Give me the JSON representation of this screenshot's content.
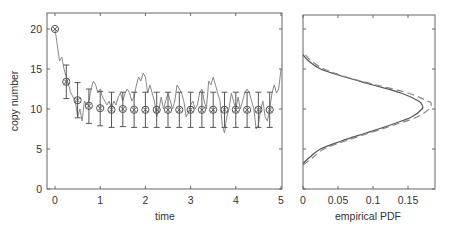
{
  "chart_data": [
    {
      "type": "line",
      "panel": "left",
      "title": "",
      "xlabel": "time",
      "ylabel": "copy number",
      "xlim": [
        -0.2,
        5
      ],
      "ylim": [
        0,
        22
      ],
      "xticks": [
        0,
        1,
        2,
        3,
        4,
        5
      ],
      "yticks": [
        0,
        5,
        10,
        15,
        20
      ],
      "grid": false,
      "series": [
        {
          "name": "sample trajectory",
          "style": "solid gray line",
          "x": [
            0,
            0.05,
            0.1,
            0.15,
            0.2,
            0.25,
            0.3,
            0.35,
            0.4,
            0.45,
            0.5,
            0.55,
            0.6,
            0.65,
            0.7,
            0.75,
            0.8,
            0.85,
            0.9,
            0.95,
            1.0,
            1.05,
            1.1,
            1.15,
            1.2,
            1.25,
            1.3,
            1.35,
            1.4,
            1.45,
            1.5,
            1.55,
            1.6,
            1.65,
            1.7,
            1.75,
            1.8,
            1.85,
            1.9,
            1.95,
            2.0,
            2.05,
            2.1,
            2.15,
            2.2,
            2.25,
            2.3,
            2.35,
            2.4,
            2.45,
            2.5,
            2.55,
            2.6,
            2.65,
            2.7,
            2.75,
            2.8,
            2.85,
            2.9,
            2.95,
            3.0,
            3.05,
            3.1,
            3.15,
            3.2,
            3.25,
            3.3,
            3.35,
            3.4,
            3.45,
            3.5,
            3.55,
            3.6,
            3.65,
            3.7,
            3.75,
            3.8,
            3.85,
            3.9,
            3.95,
            4.0,
            4.05,
            4.1,
            4.15,
            4.2,
            4.25,
            4.3,
            4.35,
            4.4,
            4.45,
            4.5,
            4.55,
            4.6,
            4.65,
            4.7,
            4.75,
            4.8,
            4.85,
            4.9,
            4.95,
            5.0
          ],
          "y": [
            20,
            18,
            16,
            16.5,
            15,
            14,
            13,
            12,
            11.5,
            11,
            9,
            10,
            8.5,
            11,
            10.5,
            11,
            12.5,
            13.5,
            13,
            12,
            12.5,
            11.5,
            11,
            10.5,
            11,
            10,
            11,
            10.5,
            11.5,
            12,
            11,
            12,
            12.5,
            12,
            11,
            11.5,
            13,
            14,
            13.5,
            14.5,
            14,
            12,
            13,
            12,
            11,
            9,
            10,
            11.5,
            10,
            11,
            12,
            11,
            10,
            11,
            13,
            12.5,
            12,
            11,
            9,
            9.5,
            10.5,
            11,
            10,
            10.5,
            12,
            12.5,
            11,
            10,
            13.5,
            13,
            14,
            13,
            12,
            11,
            8,
            7,
            9,
            10,
            12,
            11,
            10,
            11.5,
            10,
            11,
            12,
            12.5,
            12,
            11,
            10,
            7.5,
            8,
            10,
            11,
            9,
            8.5,
            10,
            12,
            13,
            12,
            12.5,
            15
          ]
        },
        {
          "name": "mean ± std (markers with error bars)",
          "style": "circle-x markers with vertical error bars",
          "x": [
            0,
            0.25,
            0.5,
            0.75,
            1.0,
            1.25,
            1.5,
            1.75,
            2.0,
            2.25,
            2.5,
            2.75,
            3.0,
            3.25,
            3.5,
            3.75,
            4.0,
            4.25,
            4.5,
            4.75
          ],
          "mean": [
            20,
            13.4,
            11.1,
            10.4,
            10.1,
            9.9,
            10.0,
            9.9,
            9.9,
            9.9,
            9.9,
            9.9,
            9.9,
            9.9,
            9.9,
            9.9,
            9.9,
            9.9,
            9.9,
            9.9
          ],
          "upper": [
            20,
            15.5,
            13.3,
            12.5,
            12.2,
            12.1,
            12.1,
            12.1,
            12.1,
            12.1,
            12.1,
            12.1,
            12.1,
            12.1,
            12.1,
            12.1,
            12.1,
            12.1,
            12.1,
            12.1
          ],
          "lower": [
            20,
            11.3,
            8.9,
            8.2,
            7.9,
            7.7,
            7.8,
            7.7,
            7.7,
            7.7,
            7.7,
            7.7,
            7.7,
            7.7,
            7.7,
            7.7,
            7.7,
            7.7,
            7.7,
            7.7
          ]
        }
      ]
    },
    {
      "type": "line",
      "panel": "right",
      "title": "",
      "xlabel": "empirical PDF",
      "ylabel": "",
      "xlim": [
        0,
        0.19
      ],
      "ylim": [
        0,
        22
      ],
      "xticks": [
        0,
        0.05,
        0.1,
        0.15
      ],
      "yticks": [
        0,
        5,
        10,
        15,
        20
      ],
      "show_ytick_labels": false,
      "grid": false,
      "orientation": "horizontal (density on x, copy number on y)",
      "series": [
        {
          "name": "empirical PDF",
          "style": "solid gray",
          "y": [
            3.2,
            4,
            5,
            6,
            7,
            8,
            9,
            10,
            10.5,
            11,
            12,
            13,
            14,
            15,
            16,
            16.8
          ],
          "x": [
            0,
            0.01,
            0.025,
            0.055,
            0.09,
            0.125,
            0.155,
            0.17,
            0.17,
            0.165,
            0.14,
            0.1,
            0.06,
            0.025,
            0.008,
            0
          ]
        },
        {
          "name": "fitted / theoretical PDF",
          "style": "dashed gray",
          "y": [
            3.0,
            4,
            5,
            6,
            7,
            8,
            9,
            10,
            10.7,
            11,
            12,
            13,
            14,
            15,
            16,
            16.8
          ],
          "x": [
            0,
            0.015,
            0.03,
            0.06,
            0.095,
            0.13,
            0.163,
            0.18,
            0.183,
            0.178,
            0.15,
            0.105,
            0.062,
            0.03,
            0.012,
            0.003
          ]
        }
      ]
    }
  ],
  "left_panel": {
    "xlabel": "time",
    "ylabel": "copy number",
    "xtick_labels": [
      "0",
      "1",
      "2",
      "3",
      "4",
      "5"
    ],
    "ytick_labels": [
      "0",
      "5",
      "10",
      "15",
      "20"
    ]
  },
  "right_panel": {
    "xlabel": "empirical PDF",
    "xtick_labels": [
      "0",
      "0.05",
      "0.1",
      "0.15"
    ]
  },
  "colors": {
    "axis": "#555555",
    "trajectory": "#8a8a8a",
    "markers": "#555555",
    "pdf_solid": "#555555",
    "pdf_dashed": "#888888"
  }
}
